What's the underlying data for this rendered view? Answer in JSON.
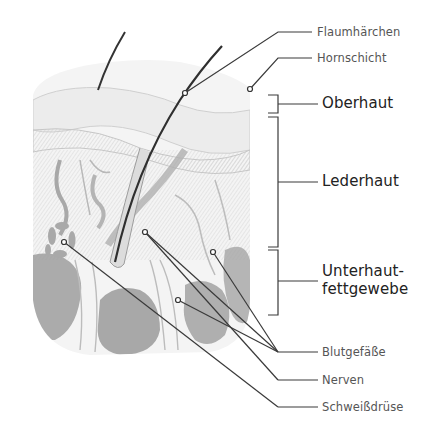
{
  "diagram": {
    "colors": {
      "line": "#3a3a3a",
      "tissue_light": "#e6e6e6",
      "tissue_mid": "#bdbdbd",
      "fat": "#9a9a9a",
      "vessel": "#a8a8a8",
      "hair": "#2f2f2f"
    },
    "callouts": [
      {
        "id": "flaumhaerchen",
        "text": "Flaumhärchen",
        "anchor": [
          185,
          93
        ]
      },
      {
        "id": "hornschicht",
        "text": "Hornschicht",
        "anchor": [
          250,
          89
        ]
      },
      {
        "id": "blutgefaesse",
        "text": "Blutgefäße",
        "anchors": [
          [
            145,
            232
          ],
          [
            213,
            252
          ],
          [
            178,
            300
          ]
        ]
      },
      {
        "id": "nerven",
        "text": "Nerven",
        "anchor": [
          145,
          232
        ]
      },
      {
        "id": "schweissdruese",
        "text": "Schweißdrüse",
        "anchor": [
          64,
          242
        ]
      }
    ],
    "layers": [
      {
        "id": "oberhaut",
        "text": "Oberhaut"
      },
      {
        "id": "lederhaut",
        "text": "Lederhaut"
      },
      {
        "id": "unterhaut",
        "line1": "Unterhaut-",
        "line2": "fettgewebe"
      }
    ]
  }
}
